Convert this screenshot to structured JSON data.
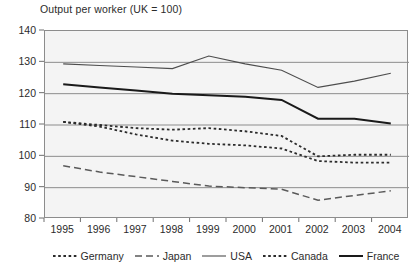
{
  "chart_data": {
    "type": "line",
    "title": "Output per worker (UK = 100)",
    "xlabel": "",
    "ylabel": "",
    "x": [
      1995,
      1996,
      1997,
      1998,
      1999,
      2000,
      2001,
      2002,
      2003,
      2004
    ],
    "xtick_labels": [
      "1995",
      "1996",
      "1997",
      "1998",
      "1999",
      "2000",
      "2001",
      "2002",
      "2003",
      "2004"
    ],
    "ytick_labels": [
      "80",
      "90",
      "100",
      "110",
      "120",
      "130",
      "140"
    ],
    "ylim": [
      80,
      140
    ],
    "ytick_step": 10,
    "grid": "horizontal",
    "legend_position": "bottom",
    "plot_background": "#f4f4f4",
    "frame_color": "#8c8c8c",
    "series": [
      {
        "name": "Germany",
        "style": "dotted",
        "color": "#2b2b2b",
        "values": [
          111.0,
          110.0,
          109.0,
          108.5,
          109.0,
          108.0,
          106.5,
          100.0,
          100.5,
          100.5
        ]
      },
      {
        "name": "Japan",
        "style": "dashed",
        "color": "#5a5a5a",
        "values": [
          97.0,
          95.0,
          93.5,
          92.0,
          90.5,
          90.0,
          89.5,
          86.0,
          87.5,
          89.0
        ]
      },
      {
        "name": "USA",
        "style": "solid",
        "color": "#4d4d4d",
        "values": [
          129.5,
          129.0,
          128.5,
          128.0,
          132.0,
          129.5,
          127.5,
          122.0,
          124.0,
          126.5
        ]
      },
      {
        "name": "Canada",
        "style": "dotted",
        "color": "#2b2b2b",
        "values": [
          111.0,
          109.5,
          107.0,
          105.0,
          104.0,
          103.5,
          102.5,
          98.5,
          98.0,
          98.0
        ]
      },
      {
        "name": "France",
        "style": "solid-bold",
        "color": "#1a1a1a",
        "values": [
          123.0,
          122.0,
          121.0,
          120.0,
          119.5,
          119.0,
          118.0,
          112.0,
          112.0,
          110.5
        ]
      }
    ]
  },
  "legend": {
    "entries": [
      {
        "label": "Germany",
        "style": "dotted"
      },
      {
        "label": "Japan",
        "style": "dashed"
      },
      {
        "label": "USA",
        "style": "solid"
      },
      {
        "label": "Canada",
        "style": "dotted"
      },
      {
        "label": "France",
        "style": "solid-bold"
      }
    ]
  }
}
